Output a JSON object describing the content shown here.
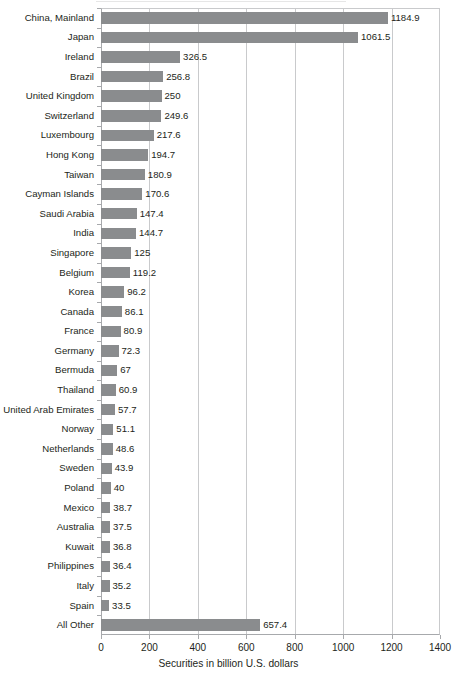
{
  "chart_data": {
    "type": "bar",
    "orientation": "horizontal",
    "title": "",
    "xlabel": "Securities in billion U.S. dollars",
    "ylabel": "",
    "xlim": [
      0,
      1400
    ],
    "xticks": [
      0,
      200,
      400,
      600,
      800,
      1000,
      1200,
      1400
    ],
    "xtick_labels": [
      "0",
      "200",
      "400",
      "600",
      "800",
      "1000",
      "1200",
      "1400"
    ],
    "grid": true,
    "grid_axis": "x",
    "legend": false,
    "bar_color": "#8a8c8e",
    "gridline_color": "#c9cacc",
    "axis_color": "#a7a9ac",
    "text_color": "#231f20",
    "categories": [
      "China, Mainland",
      "Japan",
      "Ireland",
      "Brazil",
      "United Kingdom",
      "Switzerland",
      "Luxembourg",
      "Hong Kong",
      "Taiwan",
      "Cayman Islands",
      "Saudi Arabia",
      "India",
      "Singapore",
      "Belgium",
      "Korea",
      "Canada",
      "France",
      "Germany",
      "Bermuda",
      "Thailand",
      "United Arab Emirates",
      "Norway",
      "Netherlands",
      "Sweden",
      "Poland",
      "Mexico",
      "Australia",
      "Kuwait",
      "Philippines",
      "Italy",
      "Spain",
      "All Other"
    ],
    "values": [
      1184.9,
      1061.5,
      326.5,
      256.8,
      250,
      249.6,
      217.6,
      194.7,
      180.9,
      170.6,
      147.4,
      144.7,
      125,
      119.2,
      96.2,
      86.1,
      80.9,
      72.3,
      67,
      60.9,
      57.7,
      51.1,
      48.6,
      43.9,
      40,
      38.7,
      37.5,
      36.8,
      36.4,
      35.2,
      33.5,
      657.4
    ],
    "value_labels": [
      "1184.9",
      "1061.5",
      "326.5",
      "256.8",
      "250",
      "249.6",
      "217.6",
      "194.7",
      "180.9",
      "170.6",
      "147.4",
      "144.7",
      "125",
      "119.2",
      "96.2",
      "86.1",
      "80.9",
      "72.3",
      "67",
      "60.9",
      "57.7",
      "51.1",
      "48.6",
      "43.9",
      "40",
      "38.7",
      "37.5",
      "36.8",
      "36.4",
      "35.2",
      "33.5",
      "657.4"
    ]
  }
}
